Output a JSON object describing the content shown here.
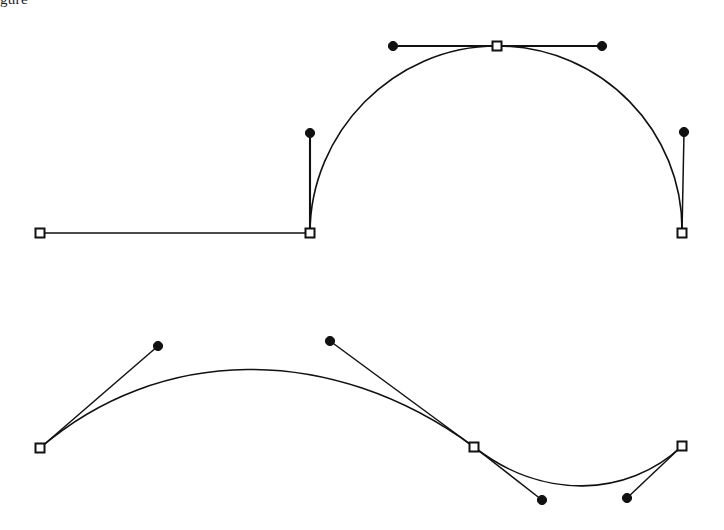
{
  "figure": {
    "caption_fragment": "gure",
    "background_color": "#ffffff",
    "stroke_color": "#111111",
    "anchor_fill_color": "#ffffff",
    "control_dot_color": "#111111",
    "width": 724,
    "height": 530
  },
  "chart_data": {
    "type": "line",
    "title": "",
    "subtitle": "",
    "xlabel": "",
    "ylabel": "",
    "xlim": [
      0,
      724
    ],
    "ylim": [
      530,
      0
    ],
    "grid": false,
    "legend": "none",
    "annotations": [],
    "series": [
      {
        "name": "upper-path",
        "kind": "bezier-path",
        "segments": [
          {
            "type": "line",
            "from": [
              40,
              233
            ],
            "to": [
              310,
              233
            ]
          },
          {
            "type": "cubic",
            "from": [
              310,
              233
            ],
            "c1": [
              310,
              133
            ],
            "c2": [
              393,
              46
            ],
            "to": [
              497,
              46
            ]
          },
          {
            "type": "cubic",
            "from": [
              497,
              46
            ],
            "c1": [
              602,
              46
            ],
            "c2": [
              684,
              132
            ],
            "to": [
              682,
              233
            ]
          }
        ],
        "anchors": [
          {
            "name": "anchor-upper-left-end",
            "x": 40,
            "y": 233,
            "shape": "square"
          },
          {
            "name": "anchor-upper-corner",
            "x": 310,
            "y": 233,
            "shape": "square"
          },
          {
            "name": "anchor-upper-apex",
            "x": 497,
            "y": 46,
            "shape": "square"
          },
          {
            "name": "anchor-upper-right-end",
            "x": 682,
            "y": 233,
            "shape": "square"
          }
        ],
        "controls": [
          {
            "name": "control-upper-corner-out",
            "x": 310,
            "y": 133,
            "shape": "dot",
            "handle_from": [
              310,
              233
            ]
          },
          {
            "name": "control-upper-apex-in",
            "x": 393,
            "y": 46,
            "shape": "dot",
            "handle_from": [
              497,
              46
            ]
          },
          {
            "name": "control-upper-apex-out",
            "x": 602,
            "y": 46,
            "shape": "dot",
            "handle_from": [
              497,
              46
            ]
          },
          {
            "name": "control-upper-right-in",
            "x": 684,
            "y": 132,
            "shape": "dot",
            "handle_from": [
              682,
              233
            ]
          }
        ]
      },
      {
        "name": "lower-path",
        "kind": "bezier-path",
        "segments": [
          {
            "type": "cubic",
            "from": [
              40,
              448
            ],
            "c1": [
              158,
              346
            ],
            "c2": [
              330,
              341
            ],
            "to": [
              474,
              447
            ]
          },
          {
            "type": "cubic",
            "from": [
              474,
              447
            ],
            "c1": [
              542,
              500
            ],
            "c2": [
              627,
              498
            ],
            "to": [
              682,
              446
            ]
          }
        ],
        "anchors": [
          {
            "name": "anchor-lower-left-end",
            "x": 40,
            "y": 448,
            "shape": "square"
          },
          {
            "name": "anchor-lower-middle",
            "x": 474,
            "y": 447,
            "shape": "square"
          },
          {
            "name": "anchor-lower-right-end",
            "x": 682,
            "y": 446,
            "shape": "square"
          }
        ],
        "controls": [
          {
            "name": "control-lower-left-out",
            "x": 158,
            "y": 346,
            "shape": "dot",
            "handle_from": [
              40,
              448
            ]
          },
          {
            "name": "control-lower-middle-in",
            "x": 330,
            "y": 341,
            "shape": "dot",
            "handle_from": [
              474,
              447
            ]
          },
          {
            "name": "control-lower-middle-out",
            "x": 542,
            "y": 500,
            "shape": "dot",
            "handle_from": [
              474,
              447
            ]
          },
          {
            "name": "control-lower-right-in",
            "x": 627,
            "y": 498,
            "shape": "dot",
            "handle_from": [
              682,
              446
            ]
          }
        ]
      }
    ]
  }
}
